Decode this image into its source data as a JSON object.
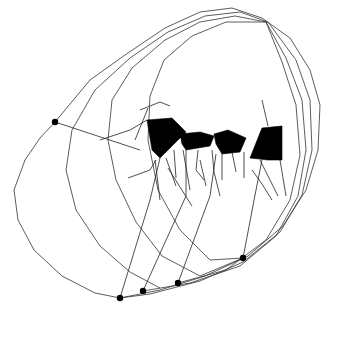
{
  "canvas": {
    "width": 341,
    "height": 337,
    "background": "#ffffff",
    "stroke_color": "#333333",
    "fill_color": "#000000"
  },
  "figure": {
    "anchor_dots": [
      {
        "x": 55,
        "y": 122
      },
      {
        "x": 120,
        "y": 298
      },
      {
        "x": 143,
        "y": 291
      },
      {
        "x": 178,
        "y": 283
      },
      {
        "x": 243,
        "y": 258
      }
    ],
    "loops": [
      "M55,122 L40,138 L25,160 L14,190 L18,220 L34,250 L62,276 L95,293 L120,298 L160,290 L205,276 L248,256 L283,226 L306,190 L318,150 L320,105 L310,70 L290,38 L262,18 L232,8 L200,12 L165,28 L125,55 L90,80 L55,122",
      "M120,298 L150,294 L200,281 L243,262 L280,232 L302,195 L312,150 L310,100 L296,60 L268,22 L240,12 L205,16 L168,32 L130,58 L95,90 L72,130 L66,170 L76,210 L100,246 L130,272 L160,288",
      "M143,291 L190,283 L240,266 L276,236 L298,196 L306,150 L302,100 L286,58 L266,22 L235,16 L200,22 L165,40 L132,68 L112,100 L108,140 L116,180 L136,222 L162,256 L200,276 L243,258",
      "M178,283 L226,270 L266,240 L290,200 L300,155 L296,105 L282,62 L266,22 L226,22 L192,36 L164,60 L150,96 L148,140 L158,190 L180,230 L210,260 L243,258"
    ],
    "seats": [
      "M147,120 L172,118 L186,132 L176,142 L160,158 L152,150 Z",
      "M180,134 L200,132 L214,136 L210,146 L186,150 L182,144 Z",
      "M214,134 L228,130 L246,138 L240,152 L222,154 L216,144 Z",
      "M262,128 L282,126 L282,160 L268,160 L250,158 Z"
    ],
    "legs": [
      "M55,122 L140,150",
      "M100,140 L130,130 L147,120",
      "M120,298 L150,200 L160,158",
      "M143,291 L186,196 L186,150",
      "M178,283 L210,196 L216,154",
      "M243,258 L256,190 L262,160",
      "M140,110 L160,102 L170,106",
      "M148,108 L135,140",
      "M128,178 L150,170 L156,160",
      "M155,160 L160,200",
      "M166,158 L176,186",
      "M174,150 L176,178",
      "M183,150 L190,190",
      "M198,150 L196,170 L204,180",
      "M212,150 L214,172 L220,196",
      "M222,154 L222,180",
      "M232,152 L236,172",
      "M244,152 L244,178",
      "M260,160 L270,180 L278,196",
      "M280,160 L286,196",
      "M262,100 L268,126",
      "M168,168 L192,206",
      "M200,160 L206,186",
      "M252,170 L262,184 L272,200"
    ]
  }
}
